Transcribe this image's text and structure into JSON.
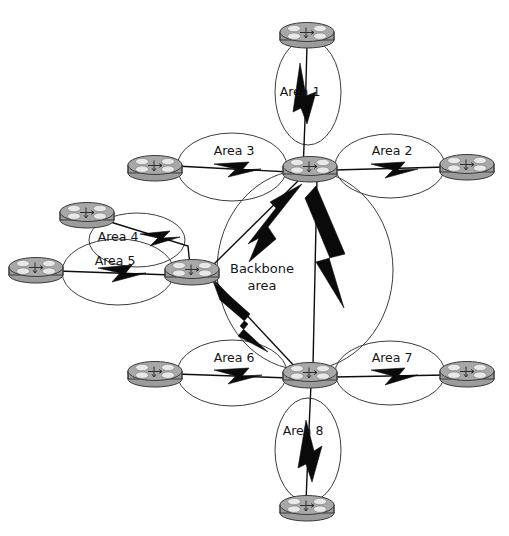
{
  "diagram": {
    "type": "network-topology",
    "colors": {
      "background": "#ffffff",
      "router_fill": "#9c9c9c",
      "router_top": "#a8a8a8",
      "router_stroke": "#3a3a3a",
      "ellipse_stroke": "#3c3c3c",
      "link_stroke": "#0d0d0d",
      "bolt_fill": "#0a0a0a",
      "text": "#161616"
    },
    "backbone": {
      "label_line1": "Backbone",
      "label_line2": "area",
      "cx": 305,
      "cy": 270,
      "rx": 88,
      "ry": 100
    },
    "areas": [
      {
        "id": "area-1",
        "label": "Area 1",
        "cx": 308,
        "cy": 92,
        "rx": 33,
        "ry": 53,
        "label_x": 300,
        "label_y": 92
      },
      {
        "id": "area-2",
        "label": "Area 2",
        "cx": 390,
        "cy": 166,
        "rx": 55,
        "ry": 32,
        "label_x": 392,
        "label_y": 151
      },
      {
        "id": "area-3",
        "label": "Area 3",
        "cx": 232,
        "cy": 167,
        "rx": 55,
        "ry": 34,
        "label_x": 234,
        "label_y": 151
      },
      {
        "id": "area-4",
        "label": "Area 4",
        "cx": 137,
        "cy": 240,
        "rx": 48,
        "ry": 27,
        "label_x": 118,
        "label_y": 237
      },
      {
        "id": "area-5",
        "label": "Area 5",
        "cx": 118,
        "cy": 272,
        "rx": 56,
        "ry": 33,
        "label_x": 115,
        "label_y": 260
      },
      {
        "id": "area-6",
        "label": "Area 6",
        "cx": 232,
        "cy": 373,
        "rx": 55,
        "ry": 33,
        "label_x": 234,
        "label_y": 358
      },
      {
        "id": "area-7",
        "label": "Area 7",
        "cx": 390,
        "cy": 373,
        "rx": 55,
        "ry": 32,
        "label_x": 392,
        "label_y": 358
      },
      {
        "id": "area-8",
        "label": "Area 8",
        "cx": 308,
        "cy": 450,
        "rx": 33,
        "ry": 52,
        "label_x": 303,
        "label_y": 431
      }
    ],
    "routers": [
      {
        "id": "router-top",
        "name": "top-router",
        "cx": 307,
        "cy": 34,
        "rx": 27,
        "ry": 8
      },
      {
        "id": "router-abr-north",
        "name": "north-abr-router",
        "cx": 310,
        "cy": 168,
        "rx": 27,
        "ry": 8
      },
      {
        "id": "router-area3-left",
        "name": "area3-left-router",
        "cx": 155,
        "cy": 167,
        "rx": 27,
        "ry": 8
      },
      {
        "id": "router-area2-right",
        "name": "area2-right-router",
        "cx": 467,
        "cy": 166,
        "rx": 27,
        "ry": 8
      },
      {
        "id": "router-area4-top",
        "name": "area4-top-router",
        "cx": 87,
        "cy": 214,
        "rx": 27,
        "ry": 8
      },
      {
        "id": "router-area5-left",
        "name": "area5-left-router",
        "cx": 36,
        "cy": 269,
        "rx": 27,
        "ry": 8
      },
      {
        "id": "router-abr-west",
        "name": "west-abr-router",
        "cx": 192,
        "cy": 271,
        "rx": 27,
        "ry": 8
      },
      {
        "id": "router-abr-south",
        "name": "south-abr-router",
        "cx": 310,
        "cy": 374,
        "rx": 27,
        "ry": 8
      },
      {
        "id": "router-area6-left",
        "name": "area6-left-router",
        "cx": 155,
        "cy": 373,
        "rx": 27,
        "ry": 8
      },
      {
        "id": "router-area7-right",
        "name": "area7-right-router",
        "cx": 467,
        "cy": 373,
        "rx": 27,
        "ry": 8
      },
      {
        "id": "router-bottom",
        "name": "bottom-router",
        "cx": 307,
        "cy": 507,
        "rx": 27,
        "ry": 8
      }
    ],
    "links": [
      {
        "id": "link-area1",
        "from": "router-top",
        "to": "router-abr-north",
        "path": "M 307 46 L 305 120 L 303 170"
      },
      {
        "id": "link-area3",
        "from": "router-area3-left",
        "to": "router-abr-north",
        "path": "M 178 166 L 288 172"
      },
      {
        "id": "link-area2",
        "from": "router-abr-north",
        "to": "router-area2-right",
        "path": "M 334 170 L 444 168"
      },
      {
        "id": "link-area4",
        "from": "router-area4-top",
        "to": "router-abr-west",
        "path": "M 108 221 L 188 244 L 190 264"
      },
      {
        "id": "link-area5",
        "from": "router-area5-left",
        "to": "router-abr-west",
        "path": "M 60 271 L 170 275"
      },
      {
        "id": "link-area6",
        "from": "router-area6-left",
        "to": "router-abr-south",
        "path": "M 178 374 L 288 378"
      },
      {
        "id": "link-area7",
        "from": "router-abr-south",
        "to": "router-area7-right",
        "path": "M 334 376 L 444 375"
      },
      {
        "id": "link-area8",
        "from": "router-abr-south",
        "to": "router-bottom",
        "path": "M 311 384 L 308 450 L 306 500"
      },
      {
        "id": "link-bb-nw",
        "from": "router-abr-north",
        "to": "router-abr-west",
        "path": "M 304 178 L 214 266"
      },
      {
        "id": "link-bb-ns",
        "from": "router-abr-north",
        "to": "router-abr-south",
        "path": "M 316 178 L 312 366"
      },
      {
        "id": "link-bb-ws",
        "from": "router-abr-west",
        "to": "router-abr-south",
        "path": "M 214 278 L 296 370"
      }
    ],
    "bolts": [
      {
        "id": "bolt-area1",
        "for": "link-area1"
      },
      {
        "id": "bolt-area2",
        "for": "link-area2"
      },
      {
        "id": "bolt-area3",
        "for": "link-area3"
      },
      {
        "id": "bolt-area4",
        "for": "link-area4"
      },
      {
        "id": "bolt-area5",
        "for": "link-area5"
      },
      {
        "id": "bolt-area6",
        "for": "link-area6"
      },
      {
        "id": "bolt-area7",
        "for": "link-area7"
      },
      {
        "id": "bolt-area8",
        "for": "link-area8"
      },
      {
        "id": "bolt-bb-nw",
        "for": "link-bb-nw"
      },
      {
        "id": "bolt-bb-ns",
        "for": "link-bb-ns"
      },
      {
        "id": "bolt-bb-ws",
        "for": "link-bb-ws"
      }
    ]
  }
}
